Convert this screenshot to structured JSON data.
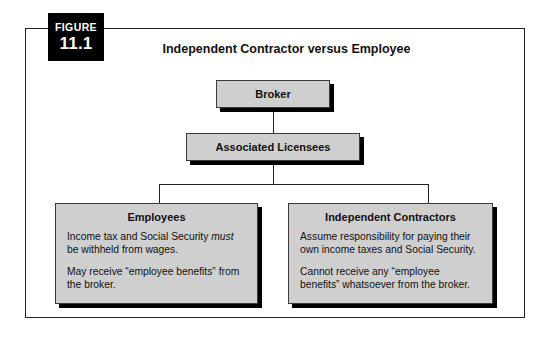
{
  "figure": {
    "badge_word": "FIGURE",
    "badge_number": "11.1",
    "title": "Independent Contractor versus Employee"
  },
  "nodes": {
    "broker": {
      "title": "Broker"
    },
    "licensees": {
      "title": "Associated Licensees"
    },
    "employees": {
      "title": "Employees",
      "line1_before": "Income tax and Social Security ",
      "line1_emph": "must",
      "line1_after": " be withheld from wages.",
      "para2": "May receive “employee benefits” from the broker."
    },
    "contractors": {
      "title": "Independent Contractors",
      "para1": "Assume responsibility for paying their own income taxes and Social Security.",
      "para2": "Cannot receive any “employee benefits” whatsoever from the broker."
    }
  },
  "colors": {
    "box_fill": "#cfcfcf",
    "box_border": "#3a3a3a",
    "shadow": "#000000",
    "badge_bg": "#000000",
    "badge_text": "#ffffff",
    "frame_border": "#222222",
    "text": "#111111"
  }
}
